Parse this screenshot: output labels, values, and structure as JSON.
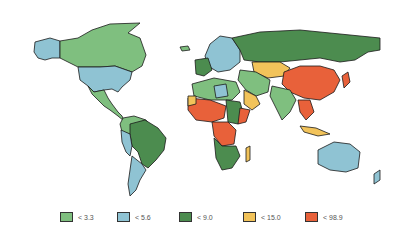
{
  "map": {
    "title": "",
    "classes": [
      {
        "label": "< 3.3",
        "color": "#7fbf7f"
      },
      {
        "label": "< 5.6",
        "color": "#8fc3d3"
      },
      {
        "label": "< 9.0",
        "color": "#4c8c4f"
      },
      {
        "label": "< 15.0",
        "color": "#f2c35a"
      },
      {
        "label": "< 98.9",
        "color": "#e8613a"
      }
    ]
  }
}
